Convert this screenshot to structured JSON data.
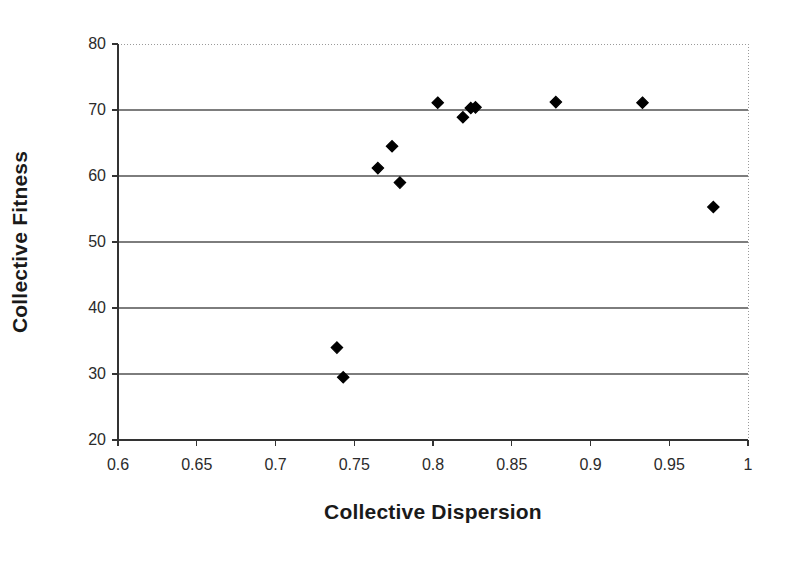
{
  "chart_data": {
    "type": "scatter",
    "title": "",
    "xlabel": "Collective Dispersion",
    "ylabel": "Collective Fitness",
    "xlim": [
      0.6,
      1.0
    ],
    "ylim": [
      20,
      80
    ],
    "xticks": [
      0.6,
      0.65,
      0.7,
      0.75,
      0.8,
      0.85,
      0.9,
      0.95,
      1
    ],
    "xtick_labels": [
      "0.6",
      "0.65",
      "0.7",
      "0.75",
      "0.8",
      "0.85",
      "0.9",
      "0.95",
      "1"
    ],
    "yticks": [
      20,
      30,
      40,
      50,
      60,
      70,
      80
    ],
    "ytick_labels": [
      "20",
      "30",
      "40",
      "50",
      "60",
      "70",
      "80"
    ],
    "grid": "horizontal",
    "grid_color": "#808080",
    "marker": "diamond",
    "marker_color": "#000000",
    "marker_size": 9,
    "legend": "none",
    "series": [
      {
        "name": "Collective Fitness vs Collective Dispersion",
        "points": [
          {
            "x": 0.739,
            "y": 34.0
          },
          {
            "x": 0.743,
            "y": 29.5
          },
          {
            "x": 0.765,
            "y": 61.2
          },
          {
            "x": 0.774,
            "y": 64.5
          },
          {
            "x": 0.779,
            "y": 59.0
          },
          {
            "x": 0.803,
            "y": 71.1
          },
          {
            "x": 0.819,
            "y": 68.9
          },
          {
            "x": 0.824,
            "y": 70.3
          },
          {
            "x": 0.827,
            "y": 70.4
          },
          {
            "x": 0.878,
            "y": 71.2
          },
          {
            "x": 0.933,
            "y": 71.1
          },
          {
            "x": 0.978,
            "y": 55.3
          }
        ]
      }
    ]
  },
  "plot_geometry": {
    "left": 118,
    "right": 748,
    "top": 44,
    "bottom": 440
  },
  "colors": {
    "background": "#ffffff",
    "axis": "#333333",
    "gridline": "#7d7d7d",
    "border_dotted": "#9a9a9a",
    "text": "#1a1a1a"
  }
}
